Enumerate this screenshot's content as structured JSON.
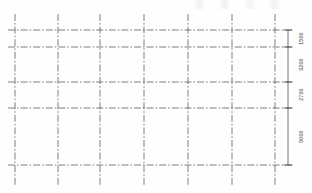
{
  "drawing": {
    "type": "structural-grid-plan",
    "title": "",
    "units": "mm",
    "line_style": "dash-dot-centerline",
    "grid_color": "#4a4a4a",
    "dimension_color": "#2e2e2e",
    "background_color": "#fefefe"
  },
  "grid": {
    "vertical_lines": [
      {
        "id": "v1",
        "x": 15,
        "top": 14,
        "bottom": 186
      },
      {
        "id": "v2",
        "x": 58,
        "top": 14,
        "bottom": 186
      },
      {
        "id": "v3",
        "x": 100,
        "top": 14,
        "bottom": 186
      },
      {
        "id": "v4",
        "x": 144,
        "top": 14,
        "bottom": 186
      },
      {
        "id": "v5",
        "x": 188,
        "top": 14,
        "bottom": 186
      },
      {
        "id": "v6",
        "x": 232,
        "top": 14,
        "bottom": 186
      },
      {
        "id": "v7",
        "x": 275,
        "top": 14,
        "bottom": 186
      }
    ],
    "horizontal_lines": [
      {
        "id": "h1",
        "y": 30,
        "left": 8,
        "right": 292
      },
      {
        "id": "h2",
        "y": 47,
        "left": 8,
        "right": 292
      },
      {
        "id": "h3",
        "y": 82,
        "left": 8,
        "right": 292
      },
      {
        "id": "h4",
        "y": 108,
        "left": 8,
        "right": 292
      },
      {
        "id": "h5",
        "y": 165,
        "left": 8,
        "right": 292
      }
    ]
  },
  "dimension_chain": {
    "orientation": "vertical",
    "x": 288,
    "start_y": 30,
    "end_y": 165,
    "tick_marks": [
      30,
      47,
      82,
      108,
      165
    ],
    "segments": [
      {
        "label": "1500",
        "from_y": 30,
        "to_y": 47,
        "mid_y": 38.5
      },
      {
        "label": "3200",
        "from_y": 47,
        "to_y": 82,
        "mid_y": 64.5
      },
      {
        "label": "2700",
        "from_y": 82,
        "to_y": 108,
        "mid_y": 95
      },
      {
        "label": "5000",
        "from_y": 108,
        "to_y": 165,
        "mid_y": 136.5
      }
    ]
  }
}
